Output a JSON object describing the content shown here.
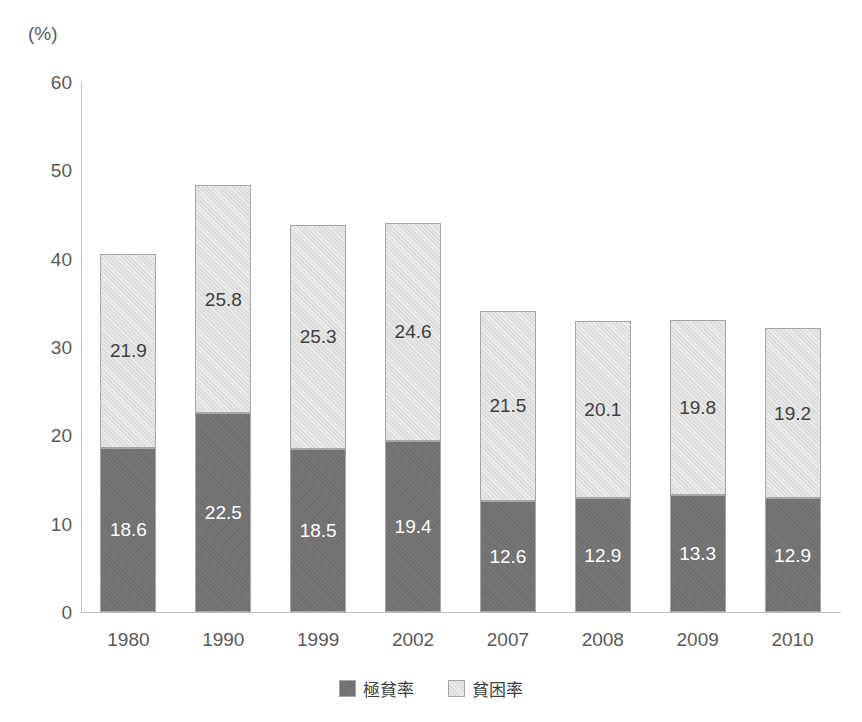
{
  "chart_data": {
    "type": "bar",
    "stacked": true,
    "title": "",
    "subtitle": "",
    "xlabel": "",
    "ylabel": "",
    "unit_label": "(%)",
    "categories": [
      "1980",
      "1990",
      "1999",
      "2002",
      "2007",
      "2008",
      "2009",
      "2010"
    ],
    "series": [
      {
        "name": "極貧率",
        "color": "#707070",
        "values": [
          18.6,
          22.5,
          18.5,
          19.4,
          12.6,
          12.9,
          13.3,
          12.9
        ]
      },
      {
        "name": "貧困率",
        "color": "#dcdcdc",
        "values": [
          21.9,
          25.8,
          25.3,
          24.6,
          21.5,
          20.1,
          19.8,
          19.2
        ]
      }
    ],
    "totals": [
      40.5,
      48.3,
      43.8,
      44.0,
      34.1,
      33.0,
      33.1,
      32.1
    ],
    "ylim": [
      0,
      60
    ],
    "yticks": [
      60,
      50,
      40,
      30,
      20,
      10,
      0
    ],
    "ytick_labels": [
      "60",
      "50",
      "40",
      "30",
      "20",
      "10",
      "0"
    ],
    "grid": false,
    "legend_position": "bottom-center"
  },
  "legend": {
    "items": [
      {
        "label": "極貧率",
        "swatch": "dark"
      },
      {
        "label": "貧困率",
        "swatch": "light"
      }
    ]
  }
}
